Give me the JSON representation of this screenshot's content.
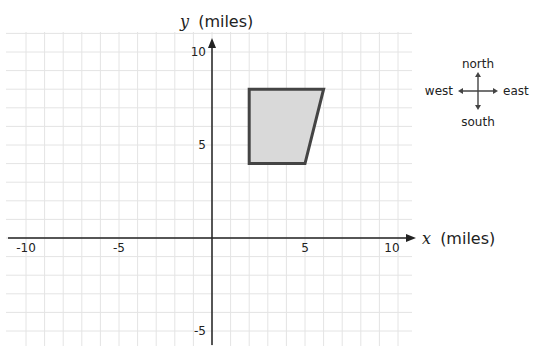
{
  "chart_data": {
    "type": "scatter",
    "title": "",
    "xlabel_var": "x",
    "xlabel_unit": "(miles)",
    "ylabel_var": "y",
    "ylabel_unit": "(miles)",
    "xlim": [
      -11,
      10.5
    ],
    "ylim": [
      -6,
      10.5
    ],
    "grid": true,
    "x_ticks": [
      -10,
      -5,
      5,
      10
    ],
    "y_ticks": [
      10,
      5,
      -5
    ],
    "x_tick_labels": [
      "-10",
      "-5",
      "5",
      "10"
    ],
    "y_tick_labels": [
      "10",
      "5",
      "-5"
    ],
    "shape": {
      "kind": "quadrilateral",
      "vertices": [
        [
          2,
          8
        ],
        [
          6,
          8
        ],
        [
          5,
          4
        ],
        [
          2,
          4
        ]
      ],
      "fill": "#d9d9d9",
      "stroke": "#444444"
    }
  },
  "compass": {
    "north": "north",
    "south": "south",
    "east": "east",
    "west": "west"
  },
  "colors": {
    "axis": "#222222",
    "grid": "#e4e4e4",
    "shape_fill": "#d9d9d9",
    "shape_stroke": "#444444"
  }
}
